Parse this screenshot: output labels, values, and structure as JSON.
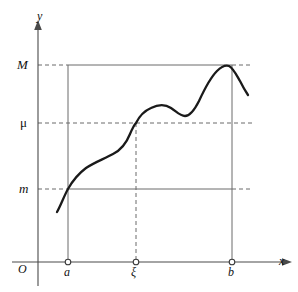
{
  "figure": {
    "kind": "math-diagram"
  },
  "axes": {
    "x_axis_label": "x",
    "y_axis_label": "y",
    "origin_label": "O"
  },
  "y_levels": [
    {
      "key": "M",
      "label": "M",
      "pixel_y": 65,
      "line_style": "solid-between-a-and-b"
    },
    {
      "key": "mu",
      "label": "μ",
      "pixel_y": 123,
      "line_style": "dashed"
    },
    {
      "key": "m",
      "label": "m",
      "pixel_y": 189,
      "line_style": "solid-between-a-and-b"
    }
  ],
  "x_marks": [
    {
      "key": "a",
      "label": "a",
      "pixel_x": 68,
      "line_style": "solid"
    },
    {
      "key": "xi",
      "label": "ξ",
      "pixel_x": 136,
      "line_style": "dashed"
    },
    {
      "key": "b",
      "label": "b",
      "pixel_x": 232,
      "line_style": "solid"
    }
  ],
  "colors": {
    "curve": "#1a1a1a",
    "axis": "#4a4a4a",
    "guide": "#6b6b6b",
    "background": "#ffffff"
  },
  "chart_data": {
    "type": "line",
    "title": "",
    "xlabel": "x",
    "ylabel": "y",
    "grid": false,
    "legend": "none",
    "annotations": [
      {
        "text": "M",
        "role": "y-tick",
        "value_axis": "y",
        "pixel": 65
      },
      {
        "text": "μ",
        "role": "y-tick",
        "value_axis": "y",
        "pixel": 123
      },
      {
        "text": "m",
        "role": "y-tick",
        "value_axis": "y",
        "pixel": 189
      },
      {
        "text": "a",
        "role": "x-tick",
        "value_axis": "x",
        "pixel": 68
      },
      {
        "text": "ξ",
        "role": "x-tick",
        "value_axis": "x",
        "pixel": 136
      },
      {
        "text": "b",
        "role": "x-tick",
        "value_axis": "x",
        "pixel": 232
      },
      {
        "text": "O",
        "role": "origin",
        "value_axis": "xy",
        "pixel": 0
      }
    ],
    "curve_pixel_points": [
      [
        57,
        212
      ],
      [
        63,
        200
      ],
      [
        68,
        189
      ],
      [
        75,
        179
      ],
      [
        84,
        170
      ],
      [
        95,
        162
      ],
      [
        106,
        157
      ],
      [
        115,
        153
      ],
      [
        122,
        147
      ],
      [
        129,
        136
      ],
      [
        136,
        123
      ],
      [
        143,
        114
      ],
      [
        151,
        108
      ],
      [
        160,
        105
      ],
      [
        170,
        107
      ],
      [
        178,
        113
      ],
      [
        184,
        116
      ],
      [
        191,
        114
      ],
      [
        198,
        104
      ],
      [
        206,
        89
      ],
      [
        214,
        75
      ],
      [
        222,
        68
      ],
      [
        228,
        66
      ],
      [
        234,
        70
      ],
      [
        240,
        80
      ],
      [
        248,
        95
      ]
    ],
    "curve_path_d": "M 57,212 C 61,205 64,196 68,189 C 73,180 78,174 86,168 C 95,162 104,159 113,154 C 121,150 126,144 130,134 C 133,127 135,124 136,123 C 139,117 144,111 151,108 C 157,105 165,104 171,108 C 177,112 180,116 185,116 C 190,116 195,109 199,101 C 205,88 210,78 217,71 C 222,66 226,65 229,66 C 233,68 236,74 240,81 C 243,87 246,92 248,95"
  }
}
